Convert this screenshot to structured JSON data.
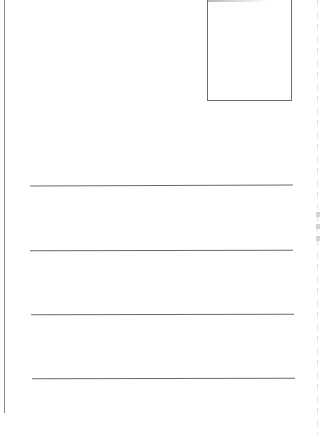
{
  "document": {
    "type": "postcard-back",
    "background_color": "#ffffff",
    "line_color": "#6a6a6a"
  },
  "layout": {
    "divider": {
      "orientation": "vertical",
      "present": true
    },
    "stamp_box": {
      "present": true,
      "label": ""
    },
    "address_lines": [
      {
        "index": 1,
        "text": ""
      },
      {
        "index": 2,
        "text": ""
      },
      {
        "index": 3,
        "text": ""
      },
      {
        "index": 4,
        "text": ""
      }
    ]
  }
}
